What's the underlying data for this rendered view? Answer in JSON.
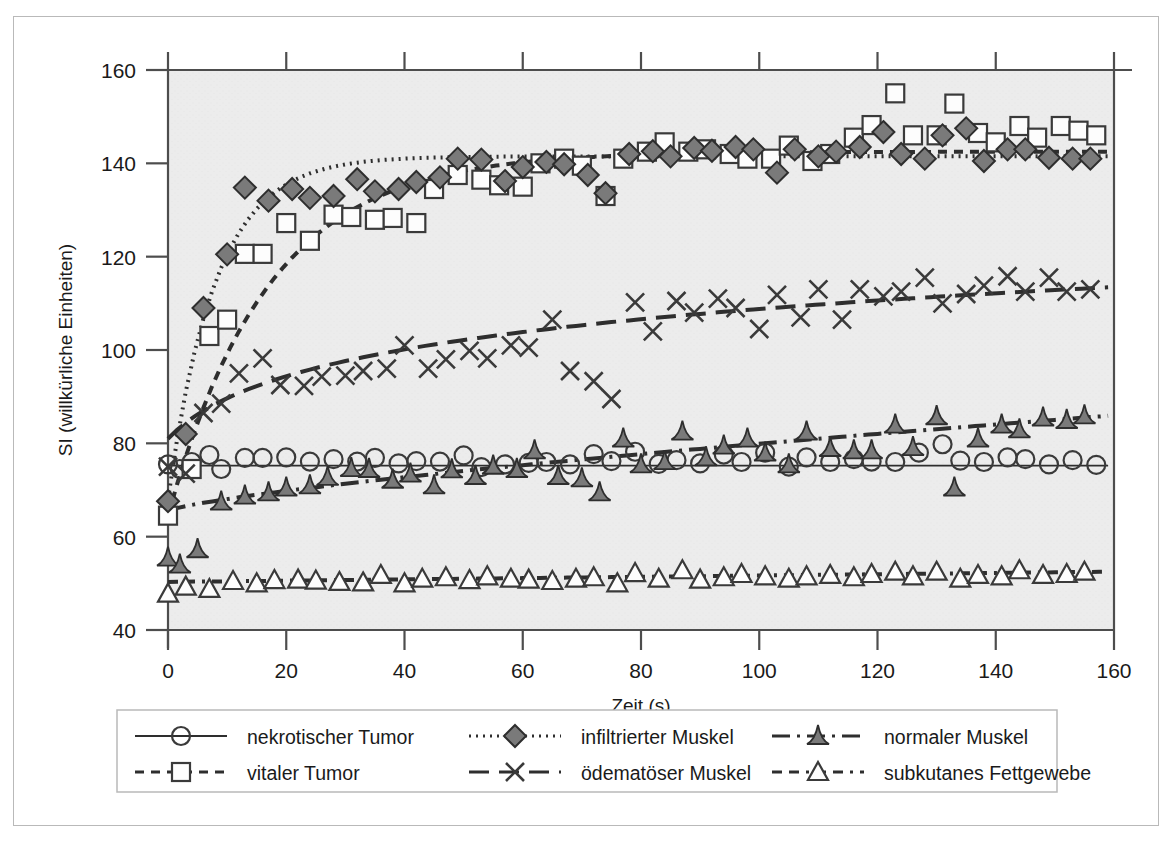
{
  "figure": {
    "background_color": "#ffffff",
    "frame_border_color": "#b9b9b9",
    "plot_background_color": "#ececec",
    "axis_color": "#4d4d4d"
  },
  "chart_data": {
    "type": "scatter",
    "title": "",
    "subtitle": "",
    "xlabel": "Zeit (s)",
    "ylabel": "SI (willkürliche Einheiten)",
    "xlim": [
      0,
      160
    ],
    "ylim": [
      40,
      160
    ],
    "xticks": [
      0,
      20,
      40,
      60,
      80,
      100,
      120,
      140,
      160
    ],
    "yticks": [
      40,
      60,
      80,
      100,
      120,
      140,
      160
    ],
    "xtick_labels": [
      "0",
      "20",
      "40",
      "60",
      "80",
      "100",
      "120",
      "140",
      "160"
    ],
    "ytick_labels": [
      "40",
      "60",
      "80",
      "100",
      "120",
      "140",
      "160"
    ],
    "grid": false,
    "legend_position": "bottom",
    "series": [
      {
        "name": "nekrotischer Tumor",
        "marker": "open-circle",
        "line_style": "solid",
        "color": "#3a3a3a",
        "fit_line": {
          "type": "flat",
          "y_start": 75.2,
          "y_end": 75.2
        },
        "x": [
          0,
          2,
          4,
          7,
          9,
          13,
          16,
          20,
          24,
          28,
          32,
          35,
          39,
          42,
          46,
          50,
          53,
          57,
          61,
          64,
          68,
          72,
          75,
          79,
          83,
          86,
          90,
          94,
          97,
          101,
          105,
          108,
          112,
          116,
          119,
          123,
          127,
          131,
          134,
          138,
          142,
          145,
          149,
          153,
          157
        ],
        "y": [
          75.5,
          74.5,
          76.0,
          77.5,
          74.5,
          76.9,
          76.9,
          77.0,
          76.1,
          76.6,
          76.1,
          76.9,
          75.7,
          76.2,
          76.1,
          77.4,
          74.9,
          75.5,
          75.8,
          76.0,
          75.5,
          77.7,
          76.2,
          78.2,
          75.6,
          76.4,
          75.7,
          77.6,
          76.0,
          78.0,
          75.0,
          77.0,
          76.0,
          76.6,
          76.1,
          76.0,
          78.0,
          79.8,
          76.3,
          76.0,
          77.0,
          76.6,
          75.5,
          76.4,
          75.4
        ]
      },
      {
        "name": "vitaler Tumor",
        "marker": "open-square",
        "line_style": "dashed",
        "color": "#3a3a3a",
        "fit_line": {
          "type": "exp-rise",
          "y0": 64.5,
          "yinf": 142.5,
          "tau": 17
        },
        "x": [
          0,
          4,
          7,
          10,
          13,
          16,
          20,
          24,
          28,
          31,
          35,
          38,
          42,
          45,
          49,
          53,
          56,
          60,
          63,
          67,
          70,
          74,
          77,
          81,
          84,
          88,
          91,
          95,
          98,
          102,
          105,
          109,
          112,
          116,
          119,
          123,
          126,
          130,
          133,
          137,
          140,
          144,
          147,
          151,
          154,
          157
        ],
        "y": [
          64.5,
          74.5,
          103.0,
          106.5,
          120.6,
          120.6,
          127.2,
          123.4,
          129.0,
          128.5,
          127.9,
          128.3,
          127.2,
          134.5,
          137.5,
          136.5,
          135.3,
          135.0,
          140.0,
          141.0,
          139.5,
          133.0,
          141.0,
          142.5,
          144.5,
          142.5,
          143.0,
          142.0,
          141.0,
          141.0,
          143.8,
          140.5,
          142.0,
          145.5,
          148.2,
          155.0,
          146.0,
          146.0,
          152.8,
          146.5,
          144.5,
          148.0,
          145.5,
          148.0,
          147.0,
          146.0
        ]
      },
      {
        "name": "infiltrierter Muskel",
        "marker": "filled-diamond",
        "line_style": "dotted",
        "color": "#3a3a3a",
        "fit_line": {
          "type": "exp-rise",
          "y0": 68.0,
          "yinf": 141.5,
          "tau": 8
        },
        "x": [
          0,
          3,
          6,
          10,
          13,
          17,
          21,
          24,
          28,
          32,
          35,
          39,
          42,
          46,
          49,
          53,
          57,
          60,
          64,
          67,
          71,
          74,
          78,
          82,
          85,
          89,
          92,
          96,
          99,
          103,
          106,
          110,
          113,
          117,
          121,
          124,
          128,
          131,
          135,
          138,
          142,
          145,
          149,
          153,
          156
        ],
        "y": [
          67.6,
          82.0,
          109.0,
          120.5,
          134.8,
          132.0,
          134.5,
          132.6,
          133.0,
          136.6,
          134.0,
          134.5,
          136.0,
          137.0,
          141.0,
          140.8,
          136.2,
          139.2,
          140.3,
          139.8,
          137.5,
          133.6,
          142.0,
          142.6,
          141.5,
          143.3,
          142.7,
          143.5,
          143.0,
          138.0,
          143.0,
          141.5,
          142.5,
          143.5,
          146.7,
          142.0,
          141.0,
          146.0,
          147.5,
          140.5,
          143.0,
          143.0,
          141.2,
          141.0,
          141.0
        ]
      },
      {
        "name": "ödematöser Muskel",
        "marker": "cross-x",
        "line_style": "long-dash",
        "color": "#3a3a3a",
        "fit_line": {
          "type": "log-rise",
          "y_start": 81.0,
          "y_end": 113.5
        },
        "x": [
          0,
          3,
          6,
          9,
          12,
          16,
          19,
          23,
          26,
          30,
          33,
          37,
          40,
          44,
          47,
          51,
          54,
          58,
          61,
          65,
          68,
          72,
          75,
          79,
          82,
          86,
          89,
          93,
          96,
          100,
          103,
          107,
          110,
          114,
          117,
          121,
          124,
          128,
          131,
          135,
          138,
          142,
          145,
          149,
          152,
          156
        ],
        "y": [
          75.0,
          73.5,
          86.5,
          88.5,
          95.0,
          98.2,
          92.5,
          92.3,
          94.3,
          94.5,
          95.5,
          96.0,
          101.0,
          96.0,
          98.0,
          99.8,
          98.2,
          101.0,
          100.5,
          106.5,
          95.5,
          93.3,
          89.5,
          110.2,
          104.0,
          110.5,
          108.0,
          111.0,
          109.0,
          104.5,
          111.8,
          107.0,
          113.0,
          106.5,
          113.0,
          111.5,
          112.5,
          115.5,
          110.0,
          112.0,
          113.8,
          115.8,
          112.5,
          115.5,
          112.5,
          113.0
        ]
      },
      {
        "name": "normaler Muskel",
        "marker": "filled-triangle",
        "line_style": "dash-dot",
        "color": "#3a3a3a",
        "fit_line": {
          "type": "slow-rise",
          "y_start": 65.5,
          "y_end": 86.0
        },
        "x": [
          0,
          2,
          5,
          9,
          13,
          17,
          20,
          24,
          27,
          31,
          34,
          38,
          41,
          45,
          48,
          52,
          55,
          59,
          62,
          66,
          70,
          73,
          77,
          80,
          84,
          87,
          91,
          94,
          98,
          101,
          105,
          108,
          112,
          116,
          119,
          123,
          126,
          130,
          133,
          137,
          141,
          144,
          148,
          152,
          155
        ],
        "y": [
          55.5,
          54.0,
          57.3,
          67.5,
          68.8,
          69.5,
          70.5,
          71.0,
          72.8,
          74.7,
          74.5,
          72.2,
          73.5,
          71.0,
          74.4,
          73.0,
          75.2,
          74.5,
          78.5,
          73.0,
          72.5,
          69.5,
          81.0,
          75.5,
          76.2,
          82.5,
          77.0,
          79.5,
          81.0,
          78.0,
          75.5,
          82.5,
          79.0,
          78.5,
          78.5,
          84.0,
          79.2,
          85.8,
          70.5,
          81.0,
          84.0,
          83.0,
          85.5,
          85.0,
          86.0
        ]
      },
      {
        "name": "subkutanes Fettgewebe",
        "marker": "open-triangle",
        "line_style": "dash-dash-dot",
        "color": "#3a3a3a",
        "fit_line": {
          "type": "flat-slight",
          "y_start": 50.3,
          "y_end": 52.5
        },
        "x": [
          0,
          3,
          7,
          11,
          15,
          18,
          22,
          25,
          29,
          33,
          36,
          40,
          43,
          47,
          51,
          54,
          58,
          61,
          65,
          69,
          72,
          76,
          79,
          83,
          87,
          90,
          94,
          97,
          101,
          105,
          108,
          112,
          116,
          119,
          123,
          126,
          130,
          134,
          137,
          141,
          144,
          148,
          152,
          155
        ],
        "y": [
          47.8,
          49.3,
          48.8,
          50.5,
          50.0,
          50.7,
          50.8,
          50.6,
          50.3,
          50.2,
          51.8,
          50.0,
          51.0,
          51.3,
          50.7,
          51.5,
          51.0,
          50.8,
          50.5,
          51.0,
          51.3,
          50.0,
          52.2,
          51.0,
          52.8,
          50.8,
          51.3,
          52.0,
          51.5,
          51.0,
          51.5,
          51.8,
          51.3,
          52.0,
          52.5,
          51.5,
          52.5,
          51.0,
          51.8,
          51.5,
          52.8,
          51.8,
          52.0,
          52.5
        ]
      }
    ]
  },
  "legend": {
    "entries": [
      {
        "label": "nekrotischer Tumor",
        "marker": "open-circle",
        "line_style": "solid"
      },
      {
        "label": "infiltrierter Muskel",
        "marker": "filled-diamond",
        "line_style": "dotted"
      },
      {
        "label": "normaler Muskel",
        "marker": "filled-triangle",
        "line_style": "dash-dot"
      },
      {
        "label": "vitaler Tumor",
        "marker": "open-square",
        "line_style": "dashed"
      },
      {
        "label": "ödematöser Muskel",
        "marker": "cross-x",
        "line_style": "long-dash"
      },
      {
        "label": "subkutanes Fettgewebe",
        "marker": "open-triangle",
        "line_style": "dash-dash-dot"
      }
    ]
  }
}
